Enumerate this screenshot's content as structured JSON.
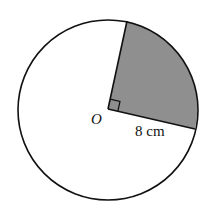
{
  "diagram": {
    "center_label": "O",
    "radius_label": "8 cm",
    "colors": {
      "outline": "#111111",
      "sector_fill": "#8f8f8f",
      "background": "#ffffff"
    },
    "sector_angle": "right angle (90°)"
  }
}
